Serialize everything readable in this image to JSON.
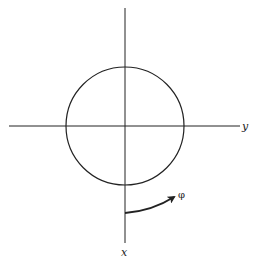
{
  "diagram": {
    "colors": {
      "stroke": "#222222",
      "background": "#ffffff"
    },
    "labels": {
      "horizontal_axis": "y",
      "vertical_axis": "x",
      "angle": "φ"
    },
    "geometry": {
      "center": [
        125,
        126
      ],
      "radius": 59,
      "horizontal_axis": {
        "x1": 9,
        "x2": 240,
        "y": 126
      },
      "vertical_axis": {
        "x": 125,
        "y1": 8,
        "y2": 243
      }
    }
  }
}
